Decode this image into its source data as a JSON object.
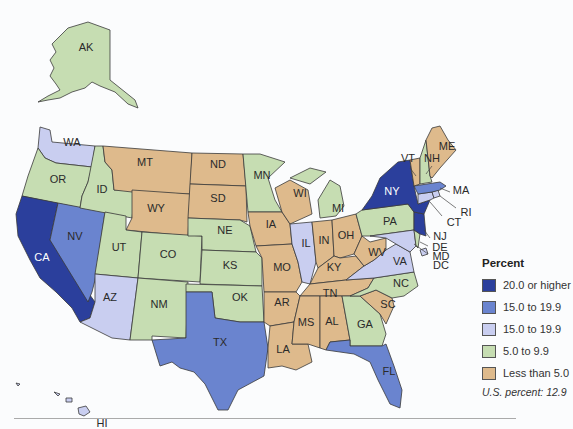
{
  "legend": {
    "title": "Percent",
    "items": [
      {
        "label": "20.0 or higher",
        "color": "#2b3f9c"
      },
      {
        "label": "15.0 to 19.9",
        "color": "#6a84cf"
      },
      {
        "label": "15.0 to 19.9",
        "color": "#c9cef0"
      },
      {
        "label": "5.0 to 9.9",
        "color": "#c6ddb2"
      },
      {
        "label": "Less than 5.0",
        "color": "#deba8c"
      }
    ],
    "note": "U.S. percent: 12.9"
  },
  "states": {
    "AK": {
      "label": "AK",
      "category": "5.0 to 9.9"
    },
    "HI": {
      "label": "HI",
      "category": "15.0 to 19.9 (light)"
    },
    "WA": {
      "label": "WA",
      "category": "15.0 to 19.9 (light)"
    },
    "OR": {
      "label": "OR",
      "category": "5.0 to 9.9"
    },
    "CA": {
      "label": "CA",
      "category": "20.0 or higher"
    },
    "NV": {
      "label": "NV",
      "category": "15.0 to 19.9"
    },
    "ID": {
      "label": "ID",
      "category": "5.0 to 9.9"
    },
    "MT": {
      "label": "MT",
      "category": "Less than 5.0"
    },
    "WY": {
      "label": "WY",
      "category": "Less than 5.0"
    },
    "UT": {
      "label": "UT",
      "category": "5.0 to 9.9"
    },
    "CO": {
      "label": "CO",
      "category": "5.0 to 9.9"
    },
    "AZ": {
      "label": "AZ",
      "category": "15.0 to 19.9 (light)"
    },
    "NM": {
      "label": "NM",
      "category": "5.0 to 9.9"
    },
    "ND": {
      "label": "ND",
      "category": "Less than 5.0"
    },
    "SD": {
      "label": "SD",
      "category": "Less than 5.0"
    },
    "NE": {
      "label": "NE",
      "category": "5.0 to 9.9"
    },
    "KS": {
      "label": "KS",
      "category": "5.0 to 9.9"
    },
    "OK": {
      "label": "OK",
      "category": "5.0 to 9.9"
    },
    "TX": {
      "label": "TX",
      "category": "15.0 to 19.9"
    },
    "MN": {
      "label": "MN",
      "category": "5.0 to 9.9"
    },
    "IA": {
      "label": "IA",
      "category": "Less than 5.0"
    },
    "MO": {
      "label": "MO",
      "category": "Less than 5.0"
    },
    "AR": {
      "label": "AR",
      "category": "Less than 5.0"
    },
    "LA": {
      "label": "LA",
      "category": "Less than 5.0"
    },
    "WI": {
      "label": "WI",
      "category": "Less than 5.0"
    },
    "IL": {
      "label": "IL",
      "category": "15.0 to 19.9 (light)"
    },
    "MI": {
      "label": "MI",
      "category": "5.0 to 9.9"
    },
    "IN": {
      "label": "IN",
      "category": "Less than 5.0"
    },
    "OH": {
      "label": "OH",
      "category": "Less than 5.0"
    },
    "KY": {
      "label": "KY",
      "category": "Less than 5.0"
    },
    "TN": {
      "label": "TN",
      "category": "Less than 5.0"
    },
    "MS": {
      "label": "MS",
      "category": "Less than 5.0"
    },
    "AL": {
      "label": "AL",
      "category": "Less than 5.0"
    },
    "GA": {
      "label": "GA",
      "category": "5.0 to 9.9"
    },
    "FL": {
      "label": "FL",
      "category": "15.0 to 19.9"
    },
    "SC": {
      "label": "SC",
      "category": "Less than 5.0"
    },
    "NC": {
      "label": "NC",
      "category": "5.0 to 9.9"
    },
    "VA": {
      "label": "VA",
      "category": "15.0 to 19.9 (light)"
    },
    "WV": {
      "label": "WV",
      "category": "Less than 5.0"
    },
    "PA": {
      "label": "PA",
      "category": "5.0 to 9.9"
    },
    "NY": {
      "label": "NY",
      "category": "20.0 or higher"
    },
    "NJ": {
      "label": "NJ",
      "category": "20.0 or higher"
    },
    "DE": {
      "label": "DE",
      "category": "5.0 to 9.9"
    },
    "MD": {
      "label": "MD",
      "category": "15.0 to 19.9 (light)"
    },
    "DC": {
      "label": "DC",
      "category": "15.0 to 19.9 (light)"
    },
    "CT": {
      "label": "CT",
      "category": "15.0 to 19.9 (light)"
    },
    "RI": {
      "label": "RI",
      "category": "15.0 to 19.9 (light)"
    },
    "MA": {
      "label": "MA",
      "category": "15.0 to 19.9"
    },
    "VT": {
      "label": "VT",
      "category": "Less than 5.0"
    },
    "NH": {
      "label": "NH",
      "category": "5.0 to 9.9"
    },
    "ME": {
      "label": "ME",
      "category": "Less than 5.0"
    }
  }
}
